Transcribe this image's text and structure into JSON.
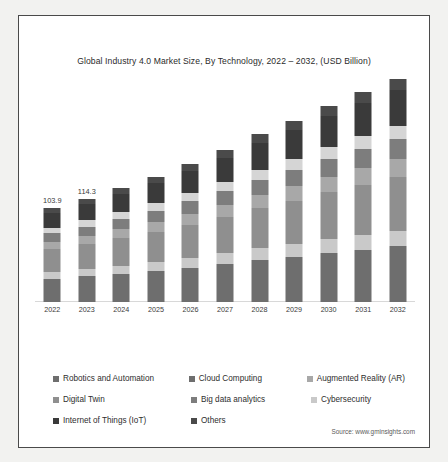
{
  "frame": {
    "source_note": "Source: www.gminsights.com"
  },
  "chart_data": {
    "type": "bar",
    "subtype": "stacked-column",
    "title": "Global Industry 4.0 Market Size, By Technology, 2022 – 2032, (USD Billion)",
    "xlabel": "",
    "ylabel": "USD Billion",
    "grid": false,
    "legend_position": "bottom",
    "ylim": [
      0,
      250
    ],
    "categories": [
      "2022",
      "2023",
      "2024",
      "2025",
      "2026",
      "2027",
      "2028",
      "2029",
      "2030",
      "2031",
      "2032"
    ],
    "totals": [
      103.9,
      114.3,
      126.0,
      138.5,
      152.5,
      168.0,
      185.5,
      200.5,
      216.5,
      232.0,
      247.0
    ],
    "point_labels": [
      "103.9",
      "114.3",
      "",
      "",
      "",
      "",
      "",
      "",
      "",
      "",
      ""
    ],
    "series": [
      {
        "name": "Robotics and Automation",
        "color": "#6e6e6e",
        "values": [
          26.0,
          28.6,
          31.5,
          34.6,
          38.1,
          42.0,
          46.4,
          50.1,
          54.1,
          58.0,
          61.8
        ]
      },
      {
        "name": "Cloud Computing",
        "color": "#c9c9c9",
        "values": [
          7.3,
          8.0,
          8.8,
          9.7,
          10.7,
          11.8,
          13.0,
          14.0,
          15.2,
          16.2,
          17.3
        ]
      },
      {
        "name": "Augmented Reality (AR)",
        "color": "#8f8f8f",
        "values": [
          24.9,
          27.4,
          30.2,
          33.2,
          36.6,
          40.3,
          44.5,
          48.1,
          51.9,
          55.7,
          59.3
        ]
      },
      {
        "name": "Digital Twin",
        "color": "#a8a8a8",
        "values": [
          8.3,
          9.1,
          10.1,
          11.1,
          12.2,
          13.4,
          14.8,
          16.0,
          17.3,
          18.6,
          19.8
        ]
      },
      {
        "name": "Big data analytics",
        "color": "#7d7d7d",
        "values": [
          9.4,
          10.3,
          11.3,
          12.5,
          13.7,
          15.1,
          16.7,
          18.0,
          19.5,
          20.9,
          22.2
        ]
      },
      {
        "name": "Cybersecurity",
        "color": "#d5d5d5",
        "values": [
          6.2,
          6.9,
          7.6,
          8.3,
          9.2,
          10.1,
          11.1,
          12.0,
          13.0,
          13.9,
          14.8
        ]
      },
      {
        "name": "Internet of Things (IoT)",
        "color": "#3a3a3a",
        "values": [
          16.6,
          18.3,
          20.2,
          22.2,
          24.4,
          26.9,
          29.7,
          32.1,
          34.6,
          37.1,
          39.5
        ]
      },
      {
        "name": "Others",
        "color": "#4a4a4a",
        "values": [
          5.2,
          5.7,
          6.3,
          6.9,
          7.6,
          8.4,
          9.3,
          10.2,
          10.9,
          11.6,
          12.3
        ]
      }
    ],
    "legend": [
      [
        {
          "label": "Robotics and Automation",
          "color": "#6e6e6e"
        },
        {
          "label": "Cloud Computing",
          "color": "#6e6e6e"
        },
        {
          "label": "Augmented Reality (AR)",
          "color": "#a8a8a8"
        }
      ],
      [
        {
          "label": "Digital Twin",
          "color": "#8f8f8f"
        },
        {
          "label": "Big data analytics",
          "color": "#7d7d7d"
        },
        {
          "label": "Cybersecurity",
          "color": "#c9c9c9"
        }
      ],
      [
        {
          "label": "Internet of Things (IoT)",
          "color": "#3a3a3a"
        },
        {
          "label": "Others",
          "color": "#4a4a4a"
        }
      ]
    ]
  }
}
